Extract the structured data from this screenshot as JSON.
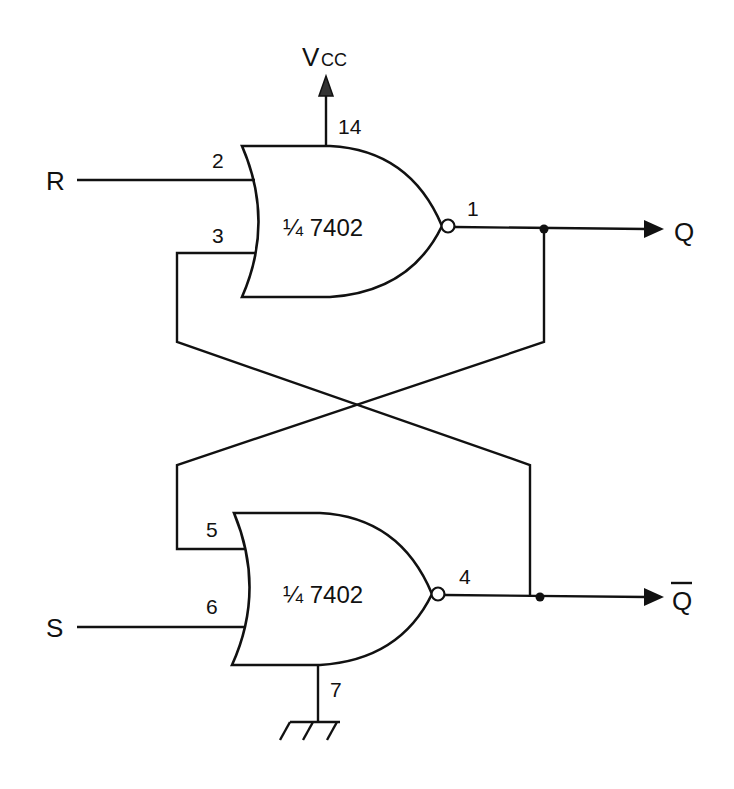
{
  "diagram": {
    "type": "SR latch (NOR gate implementation)",
    "power": {
      "label": "V",
      "sub": "CC",
      "pin": "14"
    },
    "ground": {
      "pin": "7"
    },
    "gates": [
      {
        "id": "top",
        "label": "¼ 7402",
        "inputs": [
          {
            "pin": "2",
            "signal": "R"
          },
          {
            "pin": "3",
            "signal": "feedback from Q̄"
          }
        ],
        "output": {
          "pin": "1",
          "signal": "Q"
        }
      },
      {
        "id": "bottom",
        "label": "¼ 7402",
        "inputs": [
          {
            "pin": "5",
            "signal": "feedback from Q"
          },
          {
            "pin": "6",
            "signal": "S"
          }
        ],
        "output": {
          "pin": "4",
          "signal": "Q̄"
        }
      }
    ],
    "inputs": {
      "r": "R",
      "s": "S"
    },
    "outputs": {
      "q": "Q",
      "qbar": "Q"
    }
  }
}
